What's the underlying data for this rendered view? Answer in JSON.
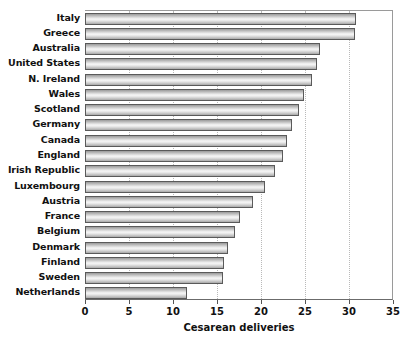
{
  "chart_data": {
    "type": "bar",
    "orientation": "horizontal",
    "title": "",
    "xlabel": "Cesarean deliveries",
    "ylabel": "",
    "xlim": [
      0,
      35
    ],
    "xticks": [
      0,
      5,
      10,
      15,
      20,
      25,
      30,
      35
    ],
    "grid": "vertical dotted gridlines at each x tick",
    "legend": "none",
    "categories": [
      "Italy",
      "Greece",
      "Australia",
      "United States",
      "N. Ireland",
      "Wales",
      "Scotland",
      "Germany",
      "Canada",
      "England",
      "Irish Republic",
      "Luxembourg",
      "Austria",
      "France",
      "Belgium",
      "Denmark",
      "Finland",
      "Sweden",
      "Netherlands"
    ],
    "values": [
      30.8,
      30.7,
      26.7,
      26.4,
      25.8,
      24.9,
      24.3,
      23.5,
      23.0,
      22.5,
      21.6,
      20.5,
      19.1,
      17.6,
      17.0,
      16.3,
      15.8,
      15.7,
      11.6
    ],
    "bar_fill": "#e2e2e2",
    "bar_edge": "#5a5a5a",
    "background": "#ffffff"
  },
  "axis": {
    "x_title": "Cesarean deliveries",
    "tick_labels": [
      "0",
      "5",
      "10",
      "15",
      "20",
      "25",
      "30",
      "35"
    ]
  }
}
